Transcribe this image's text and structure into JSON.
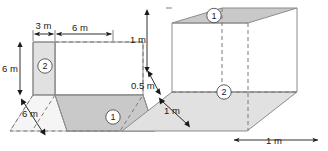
{
  "figure": {
    "colors": {
      "face_dark": "#c9c9c9",
      "face_light": "#e1e1e1",
      "face_mid": "#d6d6d6",
      "edge": "#8c8c8c",
      "dashed_edge": "#7a7a7a",
      "dimension": "#1a1a1a",
      "background": "#ffffff",
      "badge_fill": "#ffffff"
    },
    "left_diagram": {
      "name": "left-folded-plane",
      "dimensions": [
        {
          "id": "top-left-span",
          "label": "3 m",
          "orientation": "horizontal"
        },
        {
          "id": "top-right-span",
          "label": "6 m",
          "orientation": "horizontal"
        },
        {
          "id": "vertical-height",
          "label": "6 m",
          "orientation": "vertical"
        },
        {
          "id": "depth-diagonal",
          "label": "6 m",
          "orientation": "diagonal"
        }
      ],
      "badges": [
        {
          "id": "left-badge-2",
          "label": "2"
        },
        {
          "id": "left-badge-1",
          "label": "1"
        }
      ]
    },
    "right_diagram": {
      "name": "right-folded-plane",
      "dimensions": [
        {
          "id": "upper-height",
          "label": "1 m",
          "orientation": "vertical"
        },
        {
          "id": "lower-height",
          "label": "0.5 m",
          "orientation": "vertical"
        },
        {
          "id": "depth-diagonal",
          "label": "1 m",
          "orientation": "diagonal"
        },
        {
          "id": "base-width",
          "label": "1 m",
          "orientation": "horizontal"
        }
      ],
      "badges": [
        {
          "id": "right-badge-1",
          "label": "1"
        },
        {
          "id": "right-badge-2",
          "label": "2"
        }
      ]
    }
  }
}
